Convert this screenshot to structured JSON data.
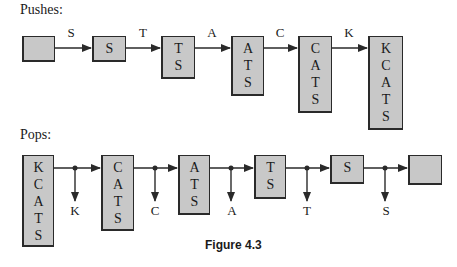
{
  "pushes": {
    "heading": "Pushes:",
    "stacks": [
      {
        "cells": []
      },
      {
        "cells": [
          "S"
        ]
      },
      {
        "cells": [
          "T",
          "S"
        ]
      },
      {
        "cells": [
          "A",
          "T",
          "S"
        ]
      },
      {
        "cells": [
          "C",
          "A",
          "T",
          "S"
        ]
      },
      {
        "cells": [
          "K",
          "C",
          "A",
          "T",
          "S"
        ]
      }
    ],
    "edge_labels": [
      "S",
      "T",
      "A",
      "C",
      "K"
    ]
  },
  "pops": {
    "heading": "Pops:",
    "stacks": [
      {
        "cells": [
          "K",
          "C",
          "A",
          "T",
          "S"
        ]
      },
      {
        "cells": [
          "C",
          "A",
          "T",
          "S"
        ]
      },
      {
        "cells": [
          "A",
          "T",
          "S"
        ]
      },
      {
        "cells": [
          "T",
          "S"
        ]
      },
      {
        "cells": [
          "S"
        ]
      },
      {
        "cells": []
      }
    ],
    "output_labels": [
      "K",
      "C",
      "A",
      "T",
      "S"
    ]
  },
  "caption": "Figure 4.3",
  "colors": {
    "box_fill": "#c8c8c8",
    "stroke": "#2a2a2a",
    "text": "#1a1a1a"
  }
}
